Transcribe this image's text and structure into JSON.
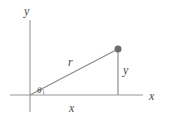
{
  "figure": {
    "background_color": "#ffffff",
    "line_color": "#8c8c8c",
    "text_color": "#4a4a4a",
    "point_color": "#6b6b6b"
  },
  "labels": {
    "y_axis": "y",
    "x_axis": "x",
    "hypotenuse": "r",
    "vertical_leg": "y",
    "horizontal_leg": "x",
    "angle": "θ"
  },
  "chart_data": {
    "type": "diagram",
    "xlabel": "x",
    "ylabel": "y",
    "grid": false,
    "legend": "none",
    "axes": {
      "y_axis": {
        "x": 30,
        "y_top": 20,
        "y_bottom": 112,
        "label": "y",
        "label_pos": [
          27,
          11
        ]
      },
      "x_axis": {
        "y": 95,
        "x_left": 10,
        "x_right": 143,
        "label": "x",
        "label_pos": [
          152,
          96
        ]
      }
    },
    "origin": [
      30,
      95
    ],
    "points": [
      {
        "name": "point-P",
        "x": 118,
        "y": 49,
        "marker": "filled-circle",
        "radius": 3.5
      }
    ],
    "segments": [
      {
        "name": "hypotenuse-r",
        "from": [
          30,
          95
        ],
        "to": [
          118,
          49
        ],
        "label": "r",
        "label_pos": [
          71,
          62
        ]
      },
      {
        "name": "vertical-leg-y",
        "from": [
          118,
          49
        ],
        "to": [
          118,
          95
        ],
        "label": "y",
        "label_pos": [
          126,
          70
        ]
      },
      {
        "name": "horizontal-leg-x",
        "from": [
          30,
          95
        ],
        "to": [
          118,
          95
        ],
        "label": "x",
        "label_pos": [
          72,
          108
        ]
      }
    ],
    "angle": {
      "name": "theta",
      "vertex": [
        30,
        95
      ],
      "label": "θ",
      "label_pos": [
        40,
        91
      ],
      "arc_radius": 14
    }
  }
}
